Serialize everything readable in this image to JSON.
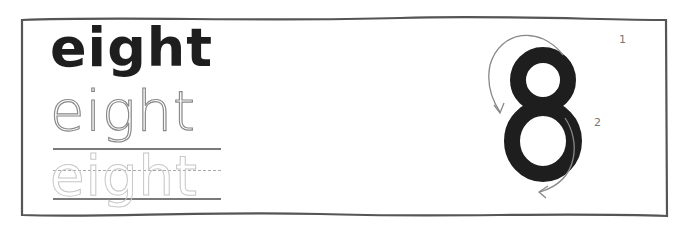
{
  "worksheet": {
    "word": "eight",
    "model_word": "eight",
    "trace_word": "eight",
    "faint_trace_word": "eight",
    "digit": "8",
    "stroke_order": [
      {
        "label": "1",
        "direction": "counter-clockwise, from top right around the top loop"
      },
      {
        "label": "2",
        "direction": "clockwise, down the right side of the bottom loop"
      }
    ],
    "colors": {
      "ink": "#1e1e1e",
      "trace": "#8a8a8a",
      "faint_trace": "#c8c8c8",
      "rule": "#7a7a7a",
      "border": "#555555"
    }
  }
}
